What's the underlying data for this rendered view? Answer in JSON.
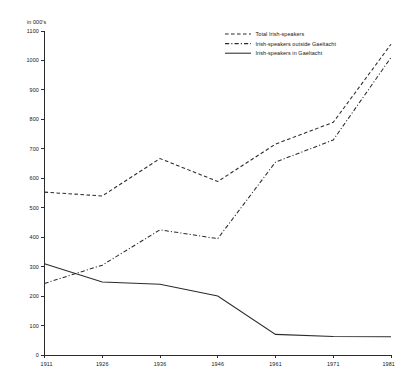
{
  "chart_data": {
    "type": "line",
    "title": "",
    "xlabel": "",
    "ylabel": "in 000's",
    "unit_label": "in 000's",
    "categories": [
      "1911",
      "1926",
      "1936",
      "1946",
      "1961",
      "1971",
      "1981"
    ],
    "x": [
      1911,
      1926,
      1936,
      1946,
      1961,
      1971,
      1981
    ],
    "ylim": [
      0,
      1100
    ],
    "y_ticks": [
      0,
      100,
      200,
      300,
      400,
      500,
      600,
      700,
      800,
      900,
      1000,
      1100
    ],
    "y_tick_labels": [
      "0",
      "100",
      "200",
      "300",
      "400",
      "500",
      "600",
      "700",
      "800",
      "900",
      "1000",
      "1100"
    ],
    "grid": false,
    "legend_position": "top-right",
    "series": [
      {
        "name": "Total Irish-speakers",
        "style": "dashed",
        "values": [
          553,
          540,
          667,
          589,
          716,
          790,
          1055
        ]
      },
      {
        "name": "Irish-speakers outside Gaeltacht",
        "style": "dash-dot",
        "values": [
          243,
          305,
          425,
          395,
          655,
          730,
          1010
        ]
      },
      {
        "name": "Irish-speakers in Gaeltacht",
        "style": "solid",
        "values": [
          310,
          248,
          240,
          200,
          70,
          63,
          62
        ]
      }
    ]
  },
  "legend": {
    "entries": [
      {
        "label": "Total Irish-speakers",
        "style": "dashed"
      },
      {
        "label": "Irish-speakers outside Gaeltacht",
        "style": "dash-dot"
      },
      {
        "label": "Irish-speakers in Gaeltacht",
        "style": "solid"
      }
    ]
  },
  "colors": {
    "ink": "#2b2b2b",
    "background": "#ffffff"
  }
}
